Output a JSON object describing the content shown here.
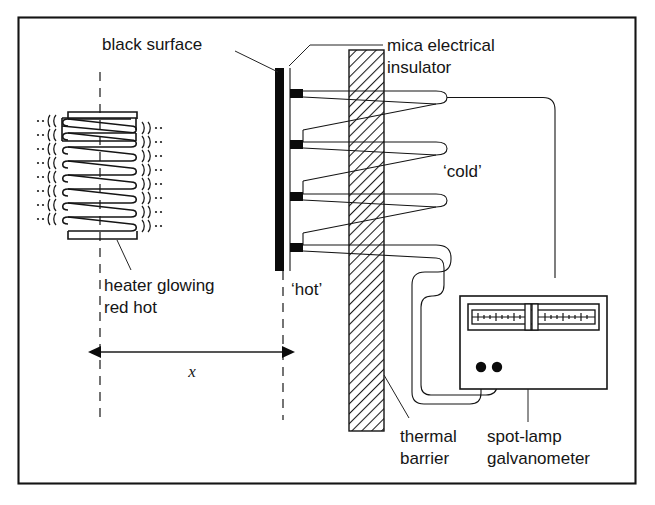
{
  "figure": {
    "title_alt": "Thermopile radiation experiment diagram",
    "border_color": "#141414",
    "background": "#ffffff"
  },
  "labels": {
    "black_surface": "black surface",
    "mica_line1": "mica electrical",
    "mica_line2": "insulator",
    "cold": "‘cold’",
    "hot": "‘hot’",
    "heater_line1": "heater glowing",
    "heater_line2": "red hot",
    "distance_symbol": "x",
    "thermal_line1": "thermal",
    "thermal_line2": "barrier",
    "galv_line1": "spot-lamp",
    "galv_line2": "galvanometer"
  },
  "components": {
    "heater_coil": {
      "name": "heater coil glowing red hot",
      "turns": 8,
      "radiation_marks_left": 8,
      "radiation_marks_right": 8
    },
    "black_surface_plate": {
      "name": "black absorbing surface",
      "color": "#0b0b0b"
    },
    "thermopile": {
      "name": "thermopile junction array",
      "hot_junctions": 4,
      "cold_junctions": 4,
      "hot_junction_color": "#0b0b0b"
    },
    "mica_insulator": {
      "name": "mica electrical insulator",
      "fill": "hatched"
    },
    "galvanometer": {
      "name": "spot-lamp galvanometer",
      "scale_ticks_left": 8,
      "scale_ticks_right": 8,
      "terminals": 2
    },
    "distance_marker": {
      "name": "distance x between heater and black surface",
      "symbol": "x"
    }
  },
  "colors": {
    "ink": "#141414",
    "black_fill": "#0b0b0b",
    "paper": "#ffffff"
  }
}
